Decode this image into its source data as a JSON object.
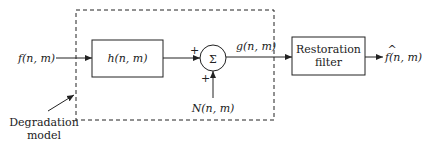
{
  "diagram": {
    "input_label": "f(n, m)",
    "degradation_block_label": "h(n, m)",
    "summation_symbol": "Σ",
    "plus_top": "+",
    "plus_bottom": "+",
    "noise_label": "N(n, m)",
    "degraded_label": "g(n, m)",
    "restoration_line1": "Restoration",
    "restoration_line2": "filter",
    "output_label": "f(n, m)",
    "output_hat": "^",
    "degradation_model_line1": "Degradation",
    "degradation_model_line2": "model"
  },
  "colors": {
    "stroke": "#222222",
    "background": "#ffffff"
  }
}
